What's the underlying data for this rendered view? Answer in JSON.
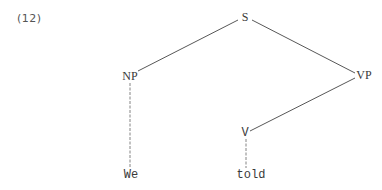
{
  "example": {
    "number": "(12)"
  },
  "tree": {
    "nodes": {
      "S": {
        "label": "S",
        "x": 245,
        "y": 17
      },
      "NP": {
        "label": "NP",
        "x": 130,
        "y": 75
      },
      "VP": {
        "label": "VP",
        "x": 364,
        "y": 75
      },
      "V": {
        "label": "V",
        "x": 245,
        "y": 132
      },
      "We": {
        "label": "We",
        "x": 130,
        "y": 175
      },
      "told": {
        "label": "told",
        "x": 250,
        "y": 175
      }
    },
    "edges": [
      [
        "S",
        "NP"
      ],
      [
        "S",
        "VP"
      ],
      [
        "NP",
        "We"
      ],
      [
        "VP",
        "V"
      ],
      [
        "V",
        "told"
      ]
    ],
    "line_color": "#444444"
  }
}
